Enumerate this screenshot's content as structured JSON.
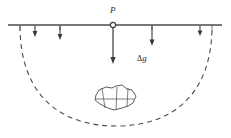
{
  "figure": {
    "labels": {
      "point": "P",
      "anomaly_symbol": "Δ",
      "anomaly_quantity": "g"
    },
    "colors": {
      "ink": "#3a3a3a",
      "ink_light": "#6e6e6e",
      "background": "#ffffff"
    },
    "surface_line": {
      "name": "ground-surface",
      "x1": 8,
      "x2": 222,
      "y": 25,
      "stroke_width": 1.4
    },
    "station_marker": {
      "name": "observation-point-P",
      "cx": 113,
      "cy": 25,
      "r": 2.6
    },
    "arrows": [
      {
        "name": "gravity-arrow-1",
        "x": 35,
        "y1": 26,
        "y2": 36
      },
      {
        "name": "gravity-arrow-2",
        "x": 60,
        "y1": 26,
        "y2": 39
      },
      {
        "name": "gravity-arrow-3",
        "x": 113,
        "y1": 27,
        "y2": 63
      },
      {
        "name": "gravity-arrow-4",
        "x": 152,
        "y1": 26,
        "y2": 45
      },
      {
        "name": "gravity-arrow-5",
        "x": 200,
        "y1": 26,
        "y2": 35
      }
    ],
    "ticks": [
      {
        "name": "tick-left",
        "x": 20,
        "y1": 25,
        "y2": 31
      },
      {
        "name": "tick-mid-left",
        "x": 60,
        "y1": 25,
        "y2": 30
      },
      {
        "name": "tick-mid-right",
        "x": 152,
        "y1": 25,
        "y2": 30
      },
      {
        "name": "tick-right",
        "x": 212,
        "y1": 25,
        "y2": 31
      }
    ],
    "influence_arc": {
      "name": "dashed-influence-boundary",
      "start_x": 20,
      "start_y": 26,
      "end_x": 212,
      "end_y": 26,
      "bottom_y": 126,
      "dash": "5 4"
    },
    "buried_body": {
      "name": "buried-anomalous-mass",
      "outline": "96,95 99,90 106,87 112,88 116,86 122,85 127,89 132,90 136,96 133,103 128,106 122,108 114,110 108,108 100,104 95,100",
      "internal_lines": [
        "102,88 105,108",
        "118,86 116,110",
        "128,88 127,107",
        "96,98 134,99"
      ]
    }
  }
}
